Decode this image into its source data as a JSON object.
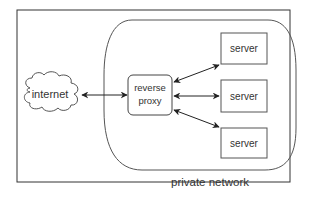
{
  "diagram": {
    "nodes": {
      "internet": {
        "label": "internet",
        "shape": "cloud"
      },
      "proxy": {
        "line1": "reverse",
        "line2": "proxy",
        "shape": "rounded-rect"
      },
      "servers": [
        {
          "label": "server"
        },
        {
          "label": "server"
        },
        {
          "label": "server"
        }
      ]
    },
    "regions": {
      "private_network": {
        "label": "private network"
      }
    },
    "edges": [
      {
        "from": "internet",
        "to": "proxy",
        "type": "bidirectional"
      },
      {
        "from": "proxy",
        "to": "server-1",
        "type": "bidirectional"
      },
      {
        "from": "proxy",
        "to": "server-2",
        "type": "bidirectional"
      },
      {
        "from": "proxy",
        "to": "server-3",
        "type": "bidirectional"
      }
    ],
    "colors": {
      "stroke": "#444444",
      "text": "#333333",
      "background": "#ffffff"
    }
  }
}
